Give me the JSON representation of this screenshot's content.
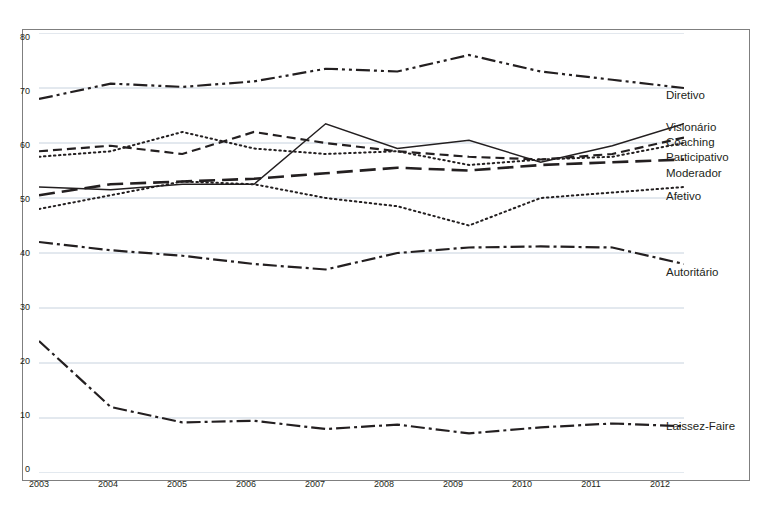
{
  "chart_data": {
    "type": "line",
    "title": "",
    "xlabel": "",
    "ylabel": "",
    "categories": [
      "2003",
      "2004",
      "2005",
      "2006",
      "2007",
      "2008",
      "2009",
      "2010",
      "2011",
      "2012"
    ],
    "ylim": [
      0,
      80
    ],
    "yticks": [
      "0",
      "10",
      "20",
      "30",
      "40",
      "50",
      "60",
      "70",
      "80"
    ],
    "grid": true,
    "legend_position": "right-inline",
    "series": [
      {
        "name": "Diretivo",
        "style": "dash-dot-dot",
        "values": [
          68,
          70.8,
          70.2,
          71.2,
          73.5,
          73,
          76,
          73,
          71.5,
          70
        ]
      },
      {
        "name": "Visionário",
        "style": "solid",
        "values": [
          52,
          51.5,
          52.5,
          52.5,
          63.5,
          59,
          60.5,
          56.5,
          59.5,
          63.5
        ]
      },
      {
        "name": "Coaching",
        "style": "dashed",
        "values": [
          58.5,
          59.5,
          58,
          62,
          60,
          58.5,
          57.5,
          57,
          58,
          61
        ]
      },
      {
        "name": "Participativo",
        "style": "dotted",
        "values": [
          57.5,
          58.5,
          62,
          59,
          58,
          58.5,
          56,
          57,
          57.5,
          60
        ]
      },
      {
        "name": "Moderador",
        "style": "long-dash",
        "values": [
          50.5,
          52.5,
          53,
          53.5,
          54.5,
          55.5,
          55,
          56,
          56.5,
          57
        ]
      },
      {
        "name": "Afetivo",
        "style": "dotted",
        "values": [
          48,
          50.5,
          53,
          52.5,
          50,
          48.5,
          45,
          50,
          51,
          52
        ]
      },
      {
        "name": "Autoritário",
        "style": "dash-dot",
        "values": [
          42,
          40.5,
          39.5,
          38,
          37,
          40,
          41,
          41.2,
          41,
          38
        ]
      },
      {
        "name": "Laissez-Faire",
        "style": "dash-dot",
        "values": [
          24,
          12,
          9.2,
          9.5,
          8,
          8.8,
          7.2,
          8.3,
          9,
          8.5
        ]
      }
    ]
  },
  "axes": {
    "y_labels": [
      "80",
      "70",
      "60",
      "50",
      "40",
      "30",
      "20",
      "10",
      "0"
    ],
    "x_labels": [
      "2003",
      "2004",
      "2005",
      "2006",
      "2007",
      "2008",
      "2009",
      "2010",
      "2011",
      "2012"
    ]
  },
  "series_labels": [
    {
      "text": "Diretivo",
      "top": 89
    },
    {
      "text": "Visionário",
      "top": 121
    },
    {
      "text": "Coaching",
      "top": 136
    },
    {
      "text": "Participativo",
      "top": 151
    },
    {
      "text": "Moderador",
      "top": 167
    },
    {
      "text": "Afetivo",
      "top": 190
    },
    {
      "text": "Autoritário",
      "top": 266
    },
    {
      "text": "Laissez-Faire",
      "top": 420
    }
  ]
}
